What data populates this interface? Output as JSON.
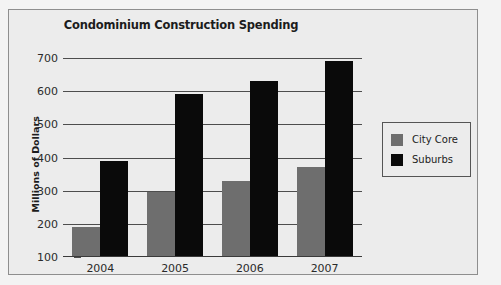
{
  "chart_data": {
    "type": "bar",
    "title": "Condominium Construction Spending",
    "xlabel": "",
    "ylabel": "Millions of Dollars",
    "categories": [
      "2004",
      "2005",
      "2006",
      "2007"
    ],
    "series": [
      {
        "name": "City Core",
        "color": "#6e6e6e",
        "values": [
          190,
          295,
          330,
          370
        ]
      },
      {
        "name": "Suburbs",
        "color": "#0a0a0a",
        "values": [
          390,
          590,
          630,
          690
        ]
      }
    ],
    "ylim": [
      100,
      700
    ],
    "yticks": [
      100,
      200,
      300,
      400,
      500,
      600,
      700
    ],
    "ytick_labels": [
      "100",
      "200",
      "300",
      "400",
      "500",
      "600",
      "700"
    ],
    "grid": true,
    "legend_position": "right",
    "legend_entries": [
      "City Core",
      "Suburbs"
    ]
  },
  "legend": {
    "items": [
      {
        "label": "City Core",
        "swatch": "legend-swatch-city-core"
      },
      {
        "label": "Suburbs",
        "swatch": "legend-swatch-suburbs"
      }
    ]
  }
}
